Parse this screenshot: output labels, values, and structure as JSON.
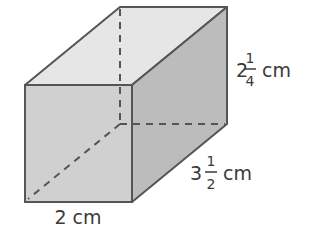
{
  "figure": {
    "type": "rectangular-prism",
    "colors": {
      "top_face": "#e6e6e6",
      "front_face": "#d0d0d0",
      "side_face": "#bcbcbc",
      "edge": "#555555",
      "hidden_edge": "#555555"
    },
    "dimensions": {
      "width": {
        "whole": "2",
        "unit": "cm",
        "text": "2 cm"
      },
      "depth": {
        "whole": "3",
        "num": "1",
        "den": "2",
        "unit": "cm"
      },
      "height": {
        "whole": "2",
        "num": "1",
        "den": "4",
        "unit": "cm"
      }
    }
  }
}
